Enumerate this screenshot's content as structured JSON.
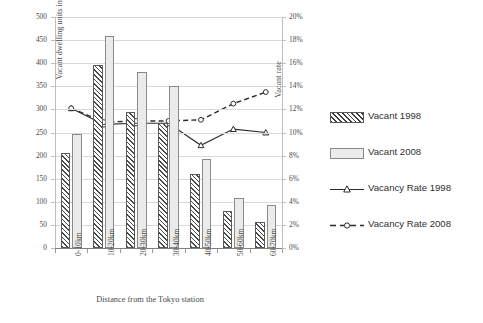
{
  "chart_data": {
    "type": "bar",
    "title": "",
    "xlabel": "Distance from the Tokyo station",
    "ylabel": "Vacant dwelling units in thousands",
    "y2label": "Vacant rate",
    "categories": [
      "0-10km",
      "10-20km",
      "20-30km",
      "30-40km",
      "40-50km",
      "50-60km",
      "60-70km"
    ],
    "ylim": [
      0,
      500
    ],
    "yticks": [
      "0",
      "50",
      "100",
      "150",
      "200",
      "250",
      "300",
      "350",
      "400",
      "450",
      "500"
    ],
    "y2lim": [
      0,
      0.2
    ],
    "y2ticks": [
      "0%",
      "2%",
      "4%",
      "6%",
      "8%",
      "10%",
      "12%",
      "14%",
      "16%",
      "18%",
      "20%"
    ],
    "grid": true,
    "legend_position": "right",
    "series": [
      {
        "name": "Vacant 1998",
        "type": "bar",
        "axis": "left",
        "values": [
          205,
          397,
          294,
          270,
          160,
          80,
          57
        ]
      },
      {
        "name": "Vacant 2008",
        "type": "bar",
        "axis": "left",
        "values": [
          247,
          458,
          381,
          350,
          192,
          109,
          93
        ]
      },
      {
        "name": "Vacancy Rate 1998",
        "type": "line",
        "axis": "right",
        "marker": "triangle",
        "style": "solid",
        "values": [
          12.1,
          10.7,
          10.8,
          10.8,
          8.9,
          10.3,
          10.0
        ]
      },
      {
        "name": "Vacancy Rate 2008",
        "type": "line",
        "axis": "right",
        "marker": "circle",
        "style": "dashed",
        "values": [
          12.1,
          10.9,
          11.0,
          11.0,
          11.1,
          12.5,
          13.5
        ]
      }
    ]
  },
  "legend": {
    "items": [
      {
        "label": "Vacant 1998",
        "key": "hatch-swatch"
      },
      {
        "label": "Vacant 2008",
        "key": "solid-swatch"
      },
      {
        "label": "Vacancy Rate 1998",
        "key": "line-triangle-solid"
      },
      {
        "label": "Vacancy Rate 2008",
        "key": "line-circle-dashed"
      }
    ]
  },
  "colors": {
    "series_1998_bar": "#4a4a4a",
    "series_2008_bar": "#ebebeb",
    "line_1998": "#2b2b2b",
    "line_2008": "#2b2b2b",
    "gridline": "#d9d9d9",
    "axis": "#808080",
    "text": "#4a4a4a",
    "background": "#ffffff"
  }
}
